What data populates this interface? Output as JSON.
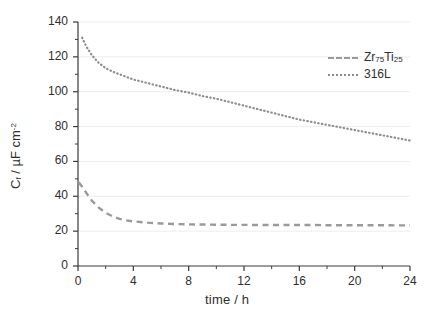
{
  "chart_data": {
    "type": "line",
    "title": "",
    "xlabel": "time / h",
    "ylabel": "C_f / µF cm⁻²",
    "ylabel_main": "C",
    "ylabel_sub": "f",
    "ylabel_rest": " / µF cm",
    "ylabel_sup": "-2",
    "xlim": [
      0,
      24
    ],
    "ylim": [
      0,
      140
    ],
    "xticks": [
      0,
      4,
      8,
      12,
      16,
      20,
      24
    ],
    "yticks": [
      0,
      20,
      40,
      60,
      80,
      100,
      120,
      140
    ],
    "xtick_labels": [
      "0",
      "4",
      "8",
      "12",
      "16",
      "20",
      "24"
    ],
    "ytick_labels": [
      "0",
      "20",
      "40",
      "60",
      "80",
      "100",
      "120",
      "140"
    ],
    "x_minor_step": 2,
    "y_minor_step": 10,
    "grid": "horizontal-major-faint",
    "legend_position": "top-right-inside",
    "series": [
      {
        "name": "Zr75Ti25",
        "label_main": "Zr",
        "label_sub1": "75",
        "label_mid": "Ti",
        "label_sub2": "25",
        "style": "dashed",
        "color": "#9a9a9a",
        "x": [
          0.05,
          0.3,
          0.6,
          1.0,
          1.5,
          2.0,
          2.5,
          3.0,
          3.5,
          4.0,
          5.0,
          6.0,
          7.0,
          8.0,
          9.0,
          10.0,
          11.0,
          12.0,
          13.0,
          14.0,
          15.0,
          16.0,
          17.0,
          18.0,
          19.0,
          20.0,
          21.0,
          22.0,
          23.0,
          24.0
        ],
        "y": [
          48.0,
          45.5,
          42.0,
          37.5,
          33.5,
          30.5,
          28.5,
          27.0,
          26.2,
          25.6,
          24.9,
          24.4,
          24.1,
          23.9,
          23.8,
          23.7,
          23.6,
          23.6,
          23.5,
          23.5,
          23.5,
          23.5,
          23.5,
          23.4,
          23.4,
          23.4,
          23.4,
          23.4,
          23.3,
          23.3
        ]
      },
      {
        "name": "316L",
        "label_main": "316L",
        "style": "dotted",
        "color": "#8d8d8d",
        "x": [
          0.3,
          0.6,
          1.0,
          1.5,
          2.0,
          2.5,
          3.0,
          3.5,
          4.0,
          5.0,
          6.0,
          7.0,
          8.0,
          9.0,
          10.0,
          11.0,
          12.0,
          13.0,
          14.0,
          15.0,
          16.0,
          17.0,
          18.0,
          19.0,
          20.0,
          21.0,
          22.0,
          23.0,
          24.0
        ],
        "y": [
          131.0,
          126.0,
          121.0,
          116.5,
          113.5,
          111.5,
          110.0,
          108.5,
          107.0,
          105.0,
          103.0,
          101.0,
          99.5,
          97.5,
          96.0,
          94.0,
          92.0,
          90.0,
          88.0,
          86.0,
          84.0,
          82.5,
          81.0,
          79.5,
          78.0,
          76.5,
          75.0,
          73.5,
          72.0
        ]
      }
    ]
  }
}
